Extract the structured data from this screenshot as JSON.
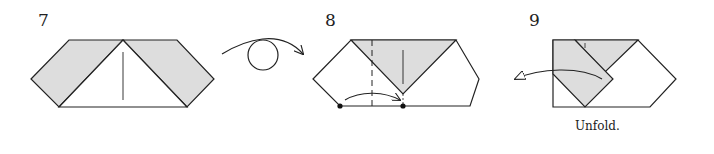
{
  "steps": [
    {
      "number": "7"
    },
    {
      "number": "8"
    },
    {
      "number": "9",
      "caption": "Unfold."
    }
  ],
  "colors": {
    "fill_shaded": "#dddddd",
    "stroke": "#222222",
    "paper": "#ffffff"
  }
}
